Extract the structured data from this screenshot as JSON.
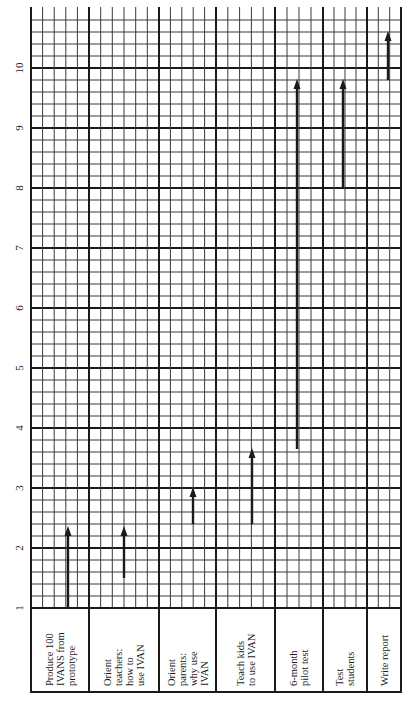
{
  "chart_data": {
    "type": "gantt",
    "orientation": "rotated 90 degrees counter-clockwise (time axis vertical, increasing upward)",
    "title": "",
    "xlabel": "",
    "ylabel": "",
    "axis": {
      "ticks": [
        1,
        2,
        3,
        4,
        5,
        6,
        7,
        8,
        9,
        10
      ],
      "range": [
        1,
        10.8
      ],
      "minor_divisions_per_unit": 5,
      "grid": true
    },
    "tasks": [
      {
        "label": [
          "Produce 100",
          "IVANS from",
          "prototype"
        ],
        "start": 1.0,
        "end": 2.35
      },
      {
        "label": [
          "Orient",
          "teachers:",
          "how to",
          "use IVAN"
        ],
        "start": 1.5,
        "end": 2.35
      },
      {
        "label": [
          "Orient",
          "parents:",
          "why use",
          "IVAN"
        ],
        "start": 2.4,
        "end": 3.0
      },
      {
        "label": [
          "Teach kids",
          "to use IVAN"
        ],
        "start": 2.4,
        "end": 3.65
      },
      {
        "label": [
          "6-month",
          "pilot test"
        ],
        "start": 3.65,
        "end": 9.8
      },
      {
        "label": [
          "Test",
          "students"
        ],
        "start": 8.0,
        "end": 9.8
      },
      {
        "label": [
          "Write report"
        ],
        "start": 9.8,
        "end": 10.6
      }
    ]
  },
  "colors": {
    "background": "#ffffff",
    "grid": "#1a1a1a",
    "arrow": "#1a1a1a"
  }
}
